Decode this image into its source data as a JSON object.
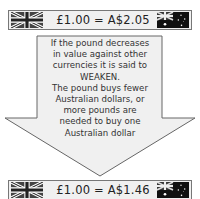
{
  "top_rate": {
    "text": "£1.00 = A$2.05",
    "left_flag": "uk-flag",
    "right_flag": "australia-flag"
  },
  "message": {
    "lines": [
      "If the pound decreases",
      "in value against other",
      "currencies it is said to",
      "WEAKEN.",
      "The pound buys fewer",
      "Australian dollars, or",
      "more pounds are",
      "needed to buy one",
      "Australian dollar"
    ]
  },
  "bottom_rate": {
    "text": "£1.00 = A$1.46",
    "left_flag": "uk-flag",
    "right_flag": "australia-flag"
  },
  "colors": {
    "arrow_fill": "#f0f0f0",
    "arrow_stroke": "#666666",
    "bar_fill": "#f0f0f0",
    "text": "#333333"
  }
}
